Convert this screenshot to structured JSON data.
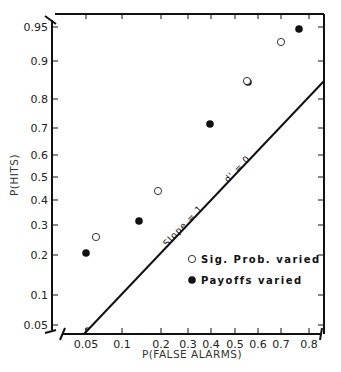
{
  "chart_data": {
    "type": "scatter",
    "title": "",
    "xlabel": "P(FALSE ALARMS)",
    "ylabel": "P(HITS)",
    "x_scale": "normal-probability",
    "y_scale": "normal-probability",
    "xlim": [
      0.04,
      0.84
    ],
    "ylim": [
      0.045,
      0.96
    ],
    "x_ticks": [
      "0.05",
      "0.1",
      "0.2",
      "0.3",
      "0.4",
      "0.5",
      "0.6",
      "0.7",
      "0.8"
    ],
    "y_ticks": [
      "0.95",
      "0.9",
      "0.8",
      "0.7",
      "0.6",
      "0.5",
      "0.4",
      "0.3",
      "0.2",
      "0.1",
      "0.05"
    ],
    "grid": false,
    "legend_position": "lower right (inside)",
    "series": [
      {
        "name": "Sig. Prob. varied",
        "marker": "open-circle",
        "points": [
          {
            "x": 0.06,
            "y": 0.26
          },
          {
            "x": 0.19,
            "y": 0.44
          },
          {
            "x": 0.55,
            "y": 0.85
          },
          {
            "x": 0.7,
            "y": 0.93
          }
        ]
      },
      {
        "name": "Payoffs varied",
        "marker": "filled-circle",
        "points": [
          {
            "x": 0.05,
            "y": 0.21
          },
          {
            "x": 0.14,
            "y": 0.32
          },
          {
            "x": 0.39,
            "y": 0.71
          },
          {
            "x": 0.56,
            "y": 0.84
          },
          {
            "x": 0.77,
            "y": 0.95
          }
        ]
      }
    ],
    "reference_line": {
      "description": "chance diagonal",
      "label_left": "Slope = 1",
      "label_right": "d' = 0"
    }
  },
  "labels": {
    "xlabel": "P(FALSE ALARMS)",
    "ylabel": "P(HITS)",
    "slope_label": "Slope = 1",
    "dprime_label": "d' = 0",
    "legend_open": "Sig. Prob. varied",
    "legend_filled": "Payoffs varied"
  },
  "ticks": {
    "x": [
      {
        "label": "0.05",
        "px": 86
      },
      {
        "label": "0.1",
        "px": 122
      },
      {
        "label": "0.2",
        "px": 161
      },
      {
        "label": "0.3",
        "px": 188
      },
      {
        "label": "0.4",
        "px": 211
      },
      {
        "label": "0.5",
        "px": 235
      },
      {
        "label": "0.6",
        "px": 258
      },
      {
        "label": "0.7",
        "px": 281
      },
      {
        "label": "0.8",
        "px": 309
      }
    ],
    "y": [
      {
        "label": "0.95",
        "px": 27
      },
      {
        "label": "0.9",
        "px": 61
      },
      {
        "label": "0.8",
        "px": 99
      },
      {
        "label": "0.7",
        "px": 128
      },
      {
        "label": "0.6",
        "px": 155
      },
      {
        "label": "0.5",
        "px": 177
      },
      {
        "label": "0.4",
        "px": 200
      },
      {
        "label": "0.3",
        "px": 225
      },
      {
        "label": "0.2",
        "px": 255
      },
      {
        "label": "0.1",
        "px": 295
      },
      {
        "label": "0.05",
        "px": 325
      }
    ]
  },
  "markers_px": {
    "open": [
      [
        96,
        237
      ],
      [
        158,
        191
      ],
      [
        247,
        81
      ],
      [
        281,
        42
      ]
    ],
    "filled": [
      [
        86,
        253
      ],
      [
        139,
        221
      ],
      [
        210,
        124
      ],
      [
        248,
        82
      ],
      [
        299,
        29
      ]
    ]
  }
}
